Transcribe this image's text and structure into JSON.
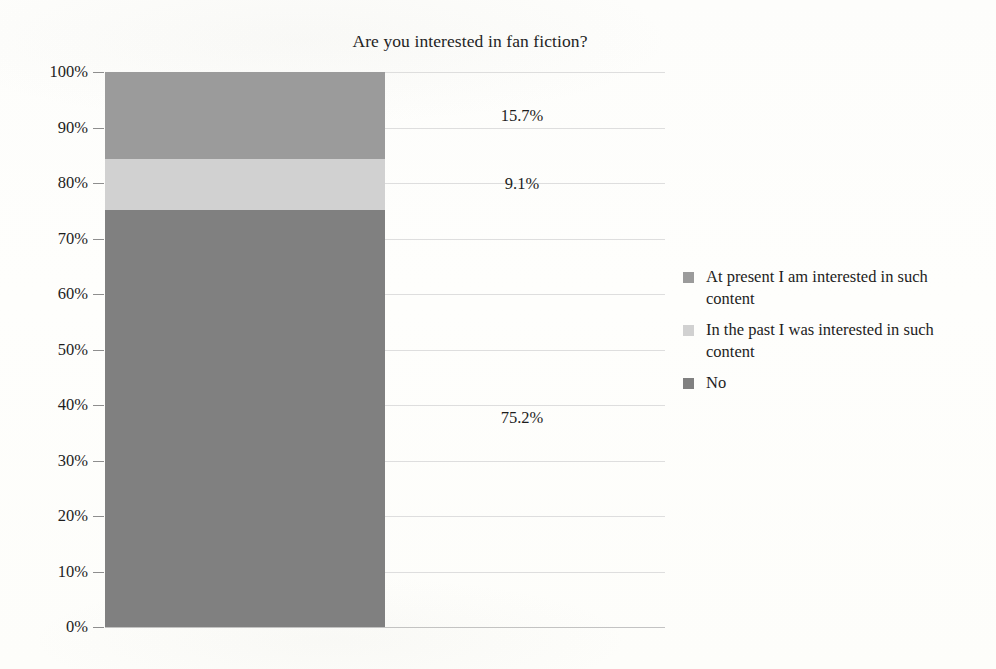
{
  "chart_data": {
    "type": "bar",
    "subtype": "stacked-100-percent",
    "title": "Are you interested in fan fiction?",
    "xlabel": "",
    "ylabel": "",
    "ylim": [
      0,
      100
    ],
    "grid": true,
    "legend_position": "right",
    "categories": [
      "Are you interested in fan fiction?"
    ],
    "ytick_labels": [
      "100%",
      "90%",
      "80%",
      "70%",
      "60%",
      "50%",
      "40%",
      "30%",
      "20%",
      "10%",
      "0%"
    ],
    "ytick_values": [
      100,
      90,
      80,
      70,
      60,
      50,
      40,
      30,
      20,
      10,
      0
    ],
    "series": [
      {
        "name": "At present I am interested in such content",
        "values": [
          15.7
        ],
        "label": "15.7%",
        "color": "#9b9b9b"
      },
      {
        "name": "In the past I was interested in such content",
        "values": [
          9.1
        ],
        "label": "9.1%",
        "color": "#d1d1d1"
      },
      {
        "name": "No",
        "values": [
          75.2
        ],
        "label": "75.2%",
        "color": "#808080"
      }
    ]
  },
  "legend": {
    "items": [
      {
        "label": "At present I am interested in such content",
        "color": "#9b9b9b"
      },
      {
        "label": "In the past I was interested in such content",
        "color": "#d1d1d1"
      },
      {
        "label": "No",
        "color": "#808080"
      }
    ]
  },
  "axis": {
    "y_ticks": [
      {
        "label": "100%",
        "value": 100
      },
      {
        "label": "90%",
        "value": 90
      },
      {
        "label": "80%",
        "value": 80
      },
      {
        "label": "70%",
        "value": 70
      },
      {
        "label": "60%",
        "value": 60
      },
      {
        "label": "50%",
        "value": 50
      },
      {
        "label": "40%",
        "value": 40
      },
      {
        "label": "30%",
        "value": 30
      },
      {
        "label": "20%",
        "value": 20
      },
      {
        "label": "10%",
        "value": 10
      },
      {
        "label": "0%",
        "value": 0
      }
    ]
  },
  "data_labels": [
    {
      "text": "15.7%",
      "at_value": 92.15
    },
    {
      "text": "9.1%",
      "at_value": 79.75
    },
    {
      "text": "75.2%",
      "at_value": 37.6
    }
  ]
}
